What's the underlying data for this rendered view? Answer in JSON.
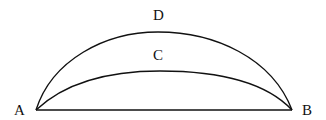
{
  "diagram": {
    "labels": {
      "a": "A",
      "b": "B",
      "c": "C",
      "d": "D"
    },
    "colors": {
      "stroke": "#111111",
      "background": "#ffffff"
    },
    "elements": [
      {
        "type": "line",
        "name": "chord AB",
        "from": "A",
        "to": "B"
      },
      {
        "type": "arc",
        "name": "arc ACB (inner, shallow)",
        "through": "C"
      },
      {
        "type": "arc",
        "name": "arc ADB (outer, high)",
        "through": "D"
      }
    ]
  }
}
